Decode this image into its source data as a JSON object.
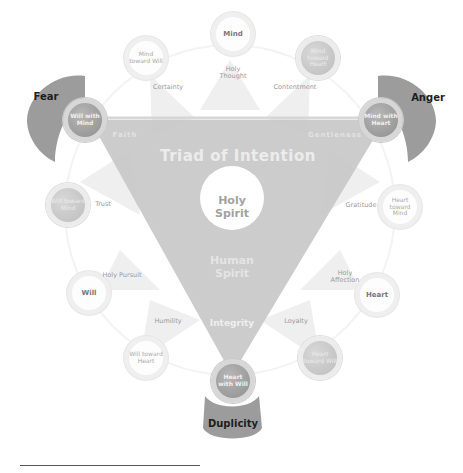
{
  "diagram": {
    "title": "Triad of Intention",
    "center": {
      "holy_spirit": "Holy Spirit",
      "human_spirit": "Human Spirit"
    },
    "triangle_corner_labels": {
      "left": "Faith",
      "right": "Gentleness",
      "bottom": "Integrity"
    },
    "emotions": [
      {
        "id": "fear",
        "label": "Fear"
      },
      {
        "id": "anger",
        "label": "Anger"
      },
      {
        "id": "duplicity",
        "label": "Duplicity"
      }
    ],
    "primary_nodes": [
      {
        "id": "mind",
        "label": "Mind"
      },
      {
        "id": "will",
        "label": "Will"
      },
      {
        "id": "heart",
        "label": "Heart"
      }
    ],
    "combined_nodes": [
      {
        "id": "will-with-mind",
        "label": "Will with Mind"
      },
      {
        "id": "mind-with-heart",
        "label": "Mind with Heart"
      },
      {
        "id": "heart-with-will",
        "label": "Heart with Will"
      }
    ],
    "toward_nodes": [
      {
        "id": "mind-toward-will",
        "label": "Mind toward Will"
      },
      {
        "id": "mind-toward-heart",
        "label": "Mind toward Heart"
      },
      {
        "id": "will-toward-mind",
        "label": "Will toward Mind"
      },
      {
        "id": "heart-toward-mind",
        "label": "Heart toward Mind"
      },
      {
        "id": "will-toward-heart",
        "label": "Will toward Heart"
      },
      {
        "id": "heart-toward-will",
        "label": "Heart toward Will"
      }
    ],
    "virtues": [
      {
        "id": "holy-thought",
        "label": "Holy Thought"
      },
      {
        "id": "certainty",
        "label": "Certainty"
      },
      {
        "id": "contentment",
        "label": "Contentment"
      },
      {
        "id": "trust",
        "label": "Trust"
      },
      {
        "id": "gratitude",
        "label": "Gratitude"
      },
      {
        "id": "holy-pursuit",
        "label": "Holy Pursuit"
      },
      {
        "id": "holy-affection",
        "label": "Holy Affection"
      },
      {
        "id": "humility",
        "label": "Humility"
      },
      {
        "id": "loyalty",
        "label": "Loyalty"
      }
    ]
  },
  "colors": {
    "emotion_shape": "#9c9c9c",
    "triangle": "#c4c4c4",
    "node_dark": "#9a9a9a",
    "node_light": "#fdfdfd",
    "virtue_triangle": "#ededed"
  }
}
